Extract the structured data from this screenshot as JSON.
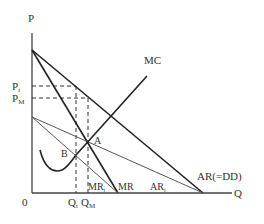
{
  "diagram": {
    "type": "economics-monopoly-tax-diagram",
    "axes": {
      "y_label": "P",
      "x_label": "Q",
      "origin_label": "0"
    },
    "price_labels": {
      "pt_main": "P",
      "pt_sub": "t",
      "pm_main": "P",
      "pm_sub": "M"
    },
    "quantity_labels": {
      "qt_main": "Q",
      "qt_sub": "t",
      "qm_main": "Q",
      "qm_sub": "M"
    },
    "curves": {
      "mc": "MC",
      "mr": "MR",
      "mrt_main": "MR",
      "mrt_sub": "t",
      "ar": "AR(=DD)",
      "art_main": "AR",
      "art_sub": "t"
    },
    "points": {
      "a": "A",
      "b": "B"
    },
    "colors": {
      "thick_line": "#222222",
      "thin_line": "#555555",
      "axis": "#444444",
      "text": "#333333"
    }
  }
}
